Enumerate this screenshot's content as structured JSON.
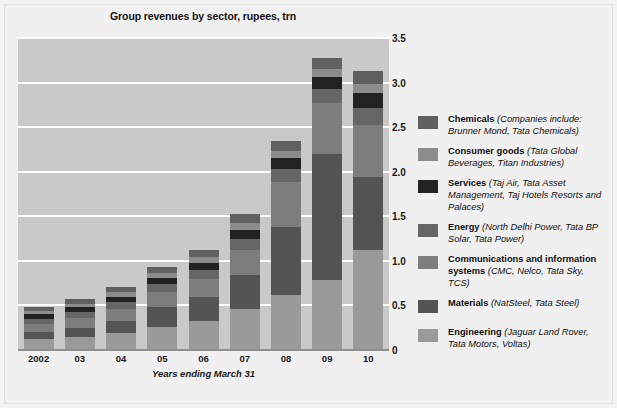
{
  "chart_data": {
    "type": "bar",
    "subtype": "stacked-column",
    "title": "Group revenues by sector, rupees, trn",
    "xlabel": "Years ending March 31",
    "ylabel": "",
    "categories": [
      "2002",
      "03",
      "04",
      "05",
      "06",
      "07",
      "08",
      "09",
      "10"
    ],
    "ylim": [
      0,
      3.5
    ],
    "yticks": [
      "0",
      "0.5",
      "1.0",
      "1.5",
      "2.0",
      "2.5",
      "3.0",
      "3.5"
    ],
    "ytick_values": [
      0,
      0.5,
      1.0,
      1.5,
      2.0,
      2.5,
      3.0,
      3.5
    ],
    "grid": true,
    "legend_position": "right",
    "stack_order_bottom_to_top": [
      "Engineering",
      "Materials",
      "Communications and information systems",
      "Energy",
      "Services",
      "Consumer goods",
      "Chemicals"
    ],
    "series": [
      {
        "name": "Engineering",
        "color": "#9a9a9a",
        "values": [
          0.12,
          0.15,
          0.19,
          0.26,
          0.33,
          0.46,
          0.62,
          0.78,
          1.12
        ]
      },
      {
        "name": "Materials",
        "color": "#545454",
        "values": [
          0.08,
          0.1,
          0.14,
          0.22,
          0.26,
          0.38,
          0.76,
          1.42,
          0.82
        ]
      },
      {
        "name": "Communications and information systems",
        "color": "#7d7d7d",
        "values": [
          0.09,
          0.11,
          0.13,
          0.17,
          0.21,
          0.28,
          0.5,
          0.57,
          0.58
        ]
      },
      {
        "name": "Energy",
        "color": "#666666",
        "values": [
          0.06,
          0.07,
          0.08,
          0.09,
          0.1,
          0.13,
          0.15,
          0.16,
          0.2
        ]
      },
      {
        "name": "Services",
        "color": "#222222",
        "values": [
          0.05,
          0.05,
          0.06,
          0.07,
          0.08,
          0.1,
          0.12,
          0.13,
          0.16
        ]
      },
      {
        "name": "Consumer goods",
        "color": "#8c8c8c",
        "values": [
          0.04,
          0.04,
          0.05,
          0.05,
          0.06,
          0.07,
          0.08,
          0.09,
          0.11
        ]
      },
      {
        "name": "Chemicals",
        "color": "#606060",
        "values": [
          0.04,
          0.05,
          0.06,
          0.07,
          0.08,
          0.11,
          0.12,
          0.13,
          0.14
        ]
      }
    ],
    "totals": [
      0.48,
      0.57,
      0.71,
      0.93,
      1.12,
      1.53,
      2.35,
      3.28,
      3.13
    ]
  },
  "legend": {
    "items": [
      {
        "name": "Chemicals",
        "desc": " (Companies include: Brunner Mond, Tata Chemicals)",
        "color": "#606060"
      },
      {
        "name": "Consumer goods",
        "desc": " (Tata Global Beverages, Titan Industries)",
        "color": "#8c8c8c"
      },
      {
        "name": "Services",
        "desc": " (Taj Air, Tata Asset Management, Taj Hotels Resorts and Palaces)",
        "color": "#222222"
      },
      {
        "name": "Energy",
        "desc": " (North Delhi Power, Tata BP Solar, Tata Power)",
        "color": "#666666"
      },
      {
        "name": "Communications and information systems",
        "desc": " (CMC, Nelco, Tata Sky, TCS)",
        "color": "#7d7d7d"
      },
      {
        "name": "Materials",
        "desc": " (NatSteel, Tata Steel)",
        "color": "#545454"
      },
      {
        "name": "Engineering",
        "desc": " (Jaguar Land Rover, Tata Motors, Voltas)",
        "color": "#9a9a9a"
      }
    ]
  },
  "colors": {
    "plot_background": "#c9c9c9",
    "figure_background": "#f0f0f0",
    "gridline": "#ffffff",
    "axis": "#8e8e8e",
    "text": "#141414"
  }
}
